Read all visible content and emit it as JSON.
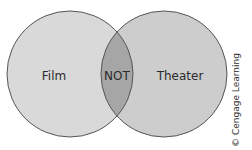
{
  "diagram": {
    "type": "venn",
    "sets": [
      {
        "label": "Film",
        "fill": "#d9d9d9"
      },
      {
        "label": "Theater",
        "fill": "#cdcdcd"
      }
    ],
    "intersection": {
      "label": "NOT",
      "fill": "#a6a6a6"
    },
    "outline_color": "#555555"
  },
  "credit": "© Cengage Learning"
}
